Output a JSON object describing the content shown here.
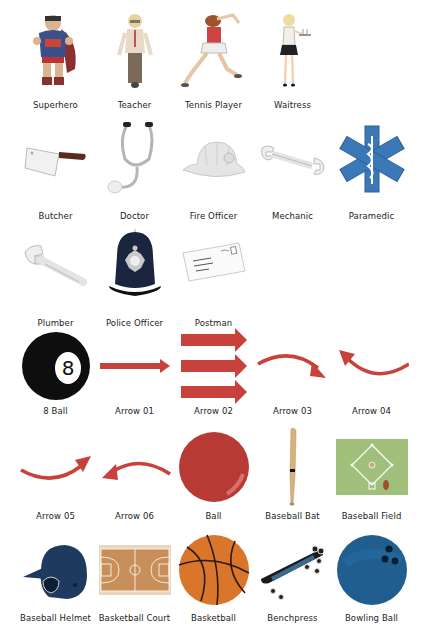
{
  "colors": {
    "label_text": "#222222",
    "arrow_red": "#c8413b",
    "eight_ball": "#111111",
    "ball_red": "#b83a35",
    "basketball": "#d9762c",
    "bowling_ball": "#1f5e8f",
    "helmet": "#1e3a5f",
    "court": "#c98f5a",
    "field": "#9fbf7a"
  },
  "rows": [
    {
      "items": [
        {
          "label": "Superhero",
          "icon": "superhero-figure"
        },
        {
          "label": "Teacher",
          "icon": "teacher-figure"
        },
        {
          "label": "Tennis Player",
          "icon": "tennis-player-figure"
        },
        {
          "label": "Waitress",
          "icon": "waitress-figure"
        }
      ]
    },
    {
      "items": [
        {
          "label": "Butcher",
          "icon": "cleaver-icon"
        },
        {
          "label": "Doctor",
          "icon": "stethoscope-icon"
        },
        {
          "label": "Fire Officer",
          "icon": "fire-helmet-icon"
        },
        {
          "label": "Mechanic",
          "icon": "wrench-icon"
        },
        {
          "label": "Paramedic",
          "icon": "star-of-life-icon"
        }
      ]
    },
    {
      "items": [
        {
          "label": "Plumber",
          "icon": "adjustable-wrench-icon"
        },
        {
          "label": "Police Officer",
          "icon": "police-helmet-icon"
        },
        {
          "label": "Postman",
          "icon": "envelope-icon"
        }
      ]
    },
    {
      "items": [
        {
          "label": "8 Ball",
          "icon": "eight-ball-icon",
          "ball_number": "8"
        },
        {
          "label": "Arrow 01",
          "icon": "arrow-straight-icon"
        },
        {
          "label": "Arrow 02",
          "icon": "arrow-triple-icon"
        },
        {
          "label": "Arrow 03",
          "icon": "arrow-curved-right-icon"
        },
        {
          "label": "Arrow 04",
          "icon": "arrow-curved-left-icon"
        }
      ]
    },
    {
      "items": [
        {
          "label": "Arrow 05",
          "icon": "arrow-curved-up-right-icon"
        },
        {
          "label": "Arrow 06",
          "icon": "arrow-curved-up-left-icon"
        },
        {
          "label": "Ball",
          "icon": "ball-icon"
        },
        {
          "label": "Baseball Bat",
          "icon": "baseball-bat-icon"
        },
        {
          "label": "Baseball Field",
          "icon": "baseball-field-icon"
        }
      ]
    },
    {
      "items": [
        {
          "label": "Baseball Helmet",
          "icon": "baseball-helmet-icon"
        },
        {
          "label": "Basketball Court",
          "icon": "basketball-court-icon"
        },
        {
          "label": "Basketball",
          "icon": "basketball-icon"
        },
        {
          "label": "Benchpress",
          "icon": "skateboard-icon"
        },
        {
          "label": "Bowling Ball",
          "icon": "bowling-ball-icon"
        }
      ]
    }
  ]
}
